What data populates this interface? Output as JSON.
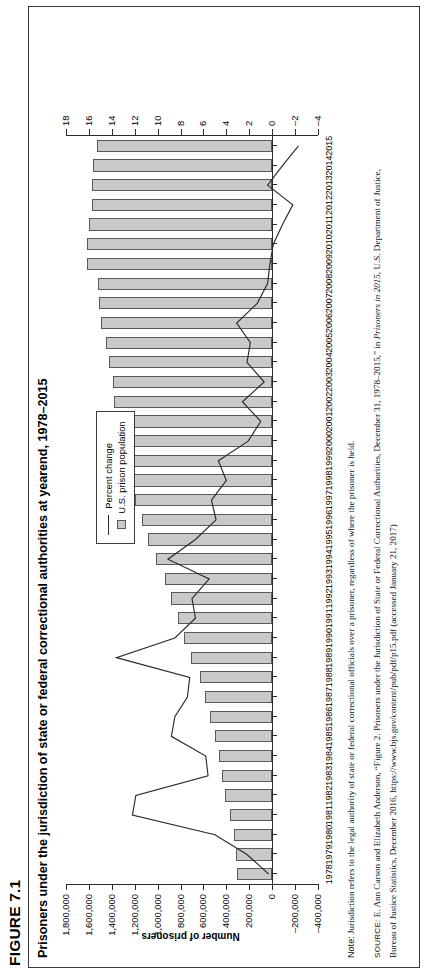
{
  "figure": {
    "label": "FIGURE 7.1",
    "title": "Prisoners under the jurisdiction of state or federal correctional authorities at yearend, 1978–2015"
  },
  "legend": {
    "items": [
      {
        "marker": "line",
        "label": "Percent change"
      },
      {
        "marker": "swatch",
        "label": "U.S. prison population"
      }
    ]
  },
  "axes": {
    "left_title": "Number of prisoners",
    "right_title": "Annual percent change",
    "left_ticks": [
      "1,800,000",
      "1,600,000",
      "1,400,000",
      "1,200,000",
      "1,000,000",
      "800,000",
      "600,000",
      "400,000",
      "200,000",
      "0",
      "–200,000",
      "–400,000"
    ],
    "right_ticks": [
      "18",
      "16",
      "14",
      "12",
      "10",
      "8",
      "6",
      "4",
      "2",
      "0",
      "–2",
      "–4"
    ]
  },
  "footnotes": {
    "note_label": "Note:",
    "note_text": " Jurisdiction refers to the legal authority of state or federal correctional officials over a prisoner, regardless of where the prisoner is held.",
    "source_label": "SOURCE:",
    "source_text_1": " E. Ann Carson and Elizabeth Anderson, “Figure 2. Prisoners under the Jurisdiction of State or Federal Correctional Authorities, December 31, 1978–2015,” in ",
    "source_italic": "Prisoners in 2015",
    "source_text_2": ", U.S. Department of Justice,",
    "source_text_3": "Bureau of Justice Statistics, December 2016, https://www.bjs.gov/content/pub/pdf/p15.pdf (accessed January 21, 2017)"
  },
  "chart_data": {
    "type": "bar",
    "title": "Prisoners under the jurisdiction of state or federal correctional authorities at yearend, 1978–2015",
    "xlabel": "",
    "ylabel": "Number of prisoners",
    "y2label": "Annual percent change",
    "ylim": [
      -400000,
      1800000
    ],
    "y2lim": [
      -4,
      18
    ],
    "grid": false,
    "legend_position": "inside-center",
    "categories": [
      "1978",
      "1979",
      "1980",
      "1981",
      "1982",
      "1983",
      "1984",
      "1985",
      "1986",
      "1987",
      "1988",
      "1989",
      "1990",
      "1991",
      "1992",
      "1993",
      "1994",
      "1995",
      "1996",
      "1997",
      "1998",
      "1999",
      "2000",
      "2001",
      "2002",
      "2003",
      "2004",
      "2005",
      "2006",
      "2007",
      "2008",
      "2009",
      "2010",
      "2011",
      "2012",
      "2013",
      "2014",
      "2015"
    ],
    "series": [
      {
        "name": "U.S. prison population",
        "type": "bar",
        "axis": "left",
        "values": [
          307276,
          314083,
          329821,
          369930,
          413806,
          436855,
          462002,
          502507,
          544972,
          585292,
          627402,
          712967,
          773919,
          825619,
          883593,
          932074,
          1016691,
          1085022,
          1137722,
          1197590,
          1245402,
          1304074,
          1331278,
          1345217,
          1380516,
          1390279,
          1421345,
          1448344,
          1492973,
          1512576,
          1518559,
          1615487,
          1613803,
          1598968,
          1570397,
          1576950,
          1562319,
          1526792
        ]
      },
      {
        "name": "Percent change",
        "type": "line",
        "axis": "right",
        "values": [
          0.3,
          2.2,
          5.0,
          12.2,
          11.9,
          5.6,
          5.8,
          8.8,
          8.5,
          7.4,
          7.2,
          13.6,
          8.5,
          6.7,
          7.0,
          5.5,
          9.1,
          6.7,
          4.9,
          5.3,
          4.0,
          4.7,
          2.1,
          1.0,
          2.6,
          0.7,
          2.2,
          1.9,
          3.1,
          1.3,
          0.4,
          0.2,
          -0.1,
          -0.9,
          -1.8,
          0.4,
          -0.9,
          -2.3
        ]
      }
    ]
  }
}
